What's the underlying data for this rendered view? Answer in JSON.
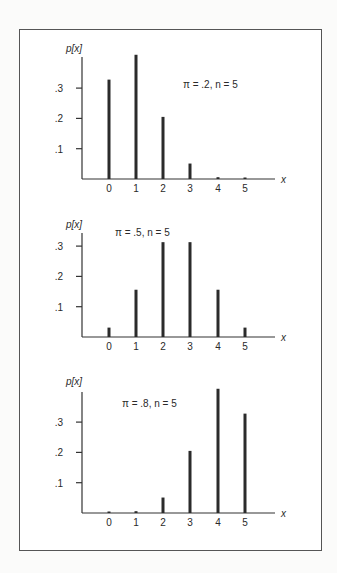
{
  "chart_data": [
    {
      "type": "bar",
      "title": "",
      "annotation": "π = .2, n = 5",
      "ylabel": "p[x]",
      "xlabel": "x",
      "categories": [
        "0",
        "1",
        "2",
        "3",
        "4",
        "5"
      ],
      "values": [
        0.328,
        0.41,
        0.205,
        0.051,
        0.006,
        0.0003
      ],
      "yticks": [
        ".1",
        ".2",
        ".3"
      ],
      "ylim": [
        0,
        0.41
      ],
      "grid": false
    },
    {
      "type": "bar",
      "title": "",
      "annotation": "π = .5, n = 5",
      "ylabel": "p[x]",
      "xlabel": "x",
      "categories": [
        "0",
        "1",
        "2",
        "3",
        "4",
        "5"
      ],
      "values": [
        0.031,
        0.156,
        0.313,
        0.313,
        0.156,
        0.031
      ],
      "yticks": [
        ".1",
        ".2",
        ".3"
      ],
      "ylim": [
        0,
        0.34
      ],
      "grid": false
    },
    {
      "type": "bar",
      "title": "",
      "annotation": "π = .8, n = 5",
      "ylabel": "p[x]",
      "xlabel": "x",
      "categories": [
        "0",
        "1",
        "2",
        "3",
        "4",
        "5"
      ],
      "values": [
        0.0003,
        0.006,
        0.051,
        0.205,
        0.41,
        0.328
      ],
      "yticks": [
        ".1",
        ".2",
        ".3"
      ],
      "ylim": [
        0,
        0.41
      ],
      "grid": false
    }
  ],
  "layout": {
    "panels": [
      {
        "baseline": 179,
        "axis_top": 57,
        "ann_x": 183,
        "ann_y": 88,
        "ylab_y": 52
      },
      {
        "baseline": 337,
        "axis_top": 233,
        "ann_x": 115,
        "ann_y": 236,
        "ylab_y": 228
      },
      {
        "baseline": 513,
        "axis_top": 392,
        "ann_x": 122,
        "ann_y": 407,
        "ylab_y": 385
      }
    ],
    "axis_x": 82,
    "axis_end": 275,
    "bar_x": [
      109,
      136,
      163,
      190,
      218,
      245
    ],
    "px_per_unit": 303
  },
  "colors": {
    "bar": "#2b2b2b",
    "axis": "#333333",
    "frame": "#555555"
  }
}
